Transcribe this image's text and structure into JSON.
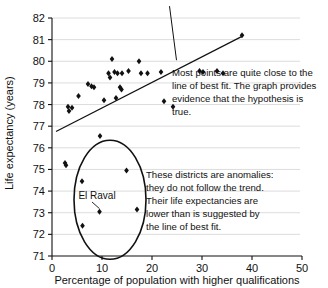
{
  "chart_data": {
    "type": "scatter",
    "title": "",
    "xlabel": "Percentage of population with higher qualifications",
    "ylabel": "Life expectancy (years)",
    "xlim": [
      0,
      50
    ],
    "ylim": [
      71,
      82
    ],
    "xticks": [
      "0",
      "10",
      "20",
      "30",
      "40",
      "50"
    ],
    "yticks": [
      "71",
      "72",
      "73",
      "74",
      "75",
      "76",
      "77",
      "78",
      "79",
      "80",
      "81",
      "82"
    ],
    "grid": "horizontal",
    "legend": "none",
    "marker": "diamond",
    "marker_color": "#111111",
    "points": [
      {
        "x": 2.6,
        "y": 75.3
      },
      {
        "x": 2.8,
        "y": 75.2
      },
      {
        "x": 3.2,
        "y": 77.9
      },
      {
        "x": 3.4,
        "y": 77.7
      },
      {
        "x": 4.0,
        "y": 77.85
      },
      {
        "x": 5.3,
        "y": 78.4
      },
      {
        "x": 6.0,
        "y": 74.45
      },
      {
        "x": 6.1,
        "y": 72.4
      },
      {
        "x": 7.2,
        "y": 78.95
      },
      {
        "x": 7.9,
        "y": 78.85
      },
      {
        "x": 8.4,
        "y": 78.8
      },
      {
        "x": 9.5,
        "y": 73.05
      },
      {
        "x": 9.6,
        "y": 76.55
      },
      {
        "x": 10.4,
        "y": 78.2
      },
      {
        "x": 11.3,
        "y": 79.45
      },
      {
        "x": 11.6,
        "y": 79.25
      },
      {
        "x": 12.0,
        "y": 80.1
      },
      {
        "x": 12.5,
        "y": 79.5
      },
      {
        "x": 12.8,
        "y": 78.3
      },
      {
        "x": 13.1,
        "y": 79.45
      },
      {
        "x": 13.6,
        "y": 78.8
      },
      {
        "x": 13.9,
        "y": 78.7
      },
      {
        "x": 14.0,
        "y": 79.45
      },
      {
        "x": 14.9,
        "y": 74.95
      },
      {
        "x": 15.3,
        "y": 79.55
      },
      {
        "x": 17.0,
        "y": 73.15
      },
      {
        "x": 17.4,
        "y": 80.0
      },
      {
        "x": 17.8,
        "y": 79.45
      },
      {
        "x": 19.1,
        "y": 79.45
      },
      {
        "x": 21.8,
        "y": 79.5
      },
      {
        "x": 22.4,
        "y": 78.15
      },
      {
        "x": 24.2,
        "y": 77.9
      },
      {
        "x": 29.5,
        "y": 79.55
      },
      {
        "x": 30.2,
        "y": 79.5
      },
      {
        "x": 33.0,
        "y": 79.55
      },
      {
        "x": 34.2,
        "y": 79.45
      },
      {
        "x": 38.0,
        "y": 81.2
      }
    ],
    "line_of_best_fit": {
      "label": "line of best fit",
      "x1": 0.8,
      "y1": 76.75,
      "x2": 38.0,
      "y2": 81.15
    },
    "extra_line": {
      "label": "leader-line-from-top",
      "x1": 23.5,
      "y1": 82.55,
      "x2": 24.9,
      "y2": 80.05
    },
    "highlight_circle": {
      "label": "anomaly-cluster-circle",
      "cx": 11.6,
      "cy": 73.6,
      "rx": 7.2,
      "ry": 2.75
    },
    "annotations": [
      {
        "id": "el-raval",
        "text": "El Raval",
        "lines": [
          "El Raval"
        ],
        "target_x": 9.5,
        "target_y": 73.05
      },
      {
        "id": "best-fit-note",
        "lines": [
          "Most points are quite close to the",
          "line of best fit. The graph provides",
          "evidence that the hypothesis is",
          "true."
        ]
      },
      {
        "id": "anomaly-note",
        "lines": [
          "These districts are anomalies:",
          "they do not follow the trend.",
          "Their life expectancies are",
          "lower than is suggested by",
          "the line of best fit."
        ]
      }
    ],
    "colors": {
      "axis": "#111111",
      "grid": "#d8d8d8",
      "marker": "#111111",
      "line": "#111111",
      "background": "#ffffff"
    }
  }
}
